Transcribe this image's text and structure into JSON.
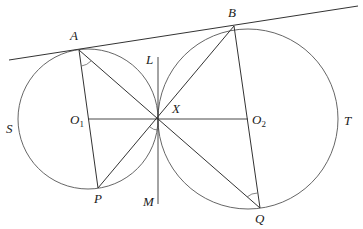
{
  "diagram": {
    "type": "geometry",
    "colors": {
      "stroke": "#333333",
      "circle": "#555555",
      "label": "#1a1a1a",
      "background": "#ffffff"
    },
    "points": {
      "A": {
        "label": "A",
        "x": 79,
        "y": 50
      },
      "B": {
        "label": "B",
        "x": 234,
        "y": 26
      },
      "X": {
        "label": "X",
        "x": 158,
        "y": 119
      },
      "O1": {
        "label": "O",
        "sub": "1",
        "x": 88,
        "y": 119
      },
      "O2": {
        "label": "O",
        "sub": "2",
        "x": 248,
        "y": 119
      },
      "P": {
        "label": "P",
        "x": 98,
        "y": 188
      },
      "Q": {
        "label": "Q",
        "x": 260,
        "y": 208
      },
      "L": {
        "label": "L",
        "x": 158,
        "y": 55
      },
      "M": {
        "label": "M",
        "x": 158,
        "y": 205
      }
    },
    "circles": [
      {
        "name": "S",
        "label": "S",
        "center": "O1",
        "r": 70
      },
      {
        "name": "T",
        "label": "T",
        "center": "O2",
        "r": 90
      }
    ],
    "segments": [
      [
        "A",
        "P"
      ],
      [
        "A",
        "X"
      ],
      [
        "B",
        "X"
      ],
      [
        "B",
        "Q"
      ],
      [
        "P",
        "X"
      ],
      [
        "X",
        "Q"
      ],
      [
        "O1",
        "O2"
      ],
      [
        "L",
        "M"
      ]
    ],
    "tangent_line": {
      "from": [
        9,
        60
      ],
      "to": [
        358,
        6
      ]
    },
    "angle_marks": [
      "A (between AP and AX)",
      "Q (between QX and QB)",
      "X (below, between XP and XM)"
    ]
  },
  "labels": {
    "A": "A",
    "B": "B",
    "X": "X",
    "L": "L",
    "M": "M",
    "P": "P",
    "Q": "Q",
    "S": "S",
    "T": "T",
    "O": "O",
    "sub1": "1",
    "sub2": "2"
  }
}
